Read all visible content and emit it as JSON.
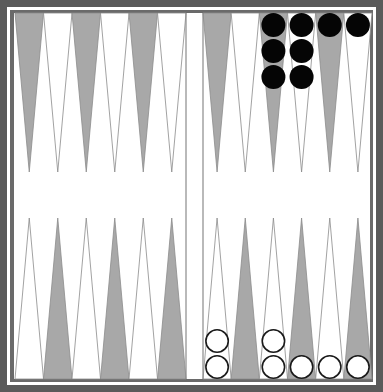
{
  "game": "backgammon",
  "colors": {
    "frame": "#5a5a5a",
    "inner_frame": "#6a6a6a",
    "board_bg": "#ffffff",
    "dark_point": "#a8a8a8",
    "light_point_stroke": "#8a8a8a",
    "black_checker": "#050505",
    "white_checker_fill": "#ffffff",
    "white_checker_stroke": "#1a1a1a"
  },
  "layout": {
    "left_half": {
      "x0": 15,
      "x1": 186
    },
    "right_half": {
      "x0": 203,
      "x1": 372
    },
    "top_y": 12,
    "bottom_y": 381,
    "top_tip_y": 172,
    "bottom_tip_y": 218,
    "checker_r": 12
  },
  "points_top_left": [
    "dark",
    "light",
    "dark",
    "light",
    "dark",
    "light"
  ],
  "points_top_right": [
    "dark",
    "light",
    "dark",
    "light",
    "dark",
    "light"
  ],
  "points_bottom_left": [
    "light",
    "dark",
    "light",
    "dark",
    "light",
    "dark"
  ],
  "points_bottom_right": [
    "light",
    "dark",
    "light",
    "dark",
    "light",
    "dark"
  ],
  "checkers": {
    "black": [
      {
        "half": "right",
        "row": "top",
        "index": 2,
        "count": 3
      },
      {
        "half": "right",
        "row": "top",
        "index": 3,
        "count": 3
      },
      {
        "half": "right",
        "row": "top",
        "index": 4,
        "count": 1
      },
      {
        "half": "right",
        "row": "top",
        "index": 5,
        "count": 1
      }
    ],
    "white": [
      {
        "half": "right",
        "row": "bottom",
        "index": 0,
        "count": 2
      },
      {
        "half": "right",
        "row": "bottom",
        "index": 2,
        "count": 2
      },
      {
        "half": "right",
        "row": "bottom",
        "index": 3,
        "count": 1
      },
      {
        "half": "right",
        "row": "bottom",
        "index": 4,
        "count": 1
      },
      {
        "half": "right",
        "row": "bottom",
        "index": 5,
        "count": 1
      }
    ]
  }
}
